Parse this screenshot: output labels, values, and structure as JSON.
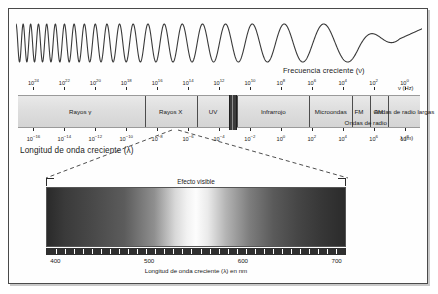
{
  "figure": {
    "frequency_caption": "Frecuencia creciente (ν)",
    "wavelength_caption": "Longitud de onda creciente (λ)",
    "frequency_unit": "ν (Hz)",
    "wavelength_unit": "λ (m)"
  },
  "chart_data": {
    "type": "bar",
    "xlabel": "Longitud de onda creciente (λ)",
    "ylabel": "",
    "frequency_axis": {
      "label": "Frecuencia creciente (ν)",
      "unit": "ν (Hz)",
      "exponents": [
        24,
        22,
        20,
        18,
        16,
        14,
        12,
        10,
        8,
        6,
        4,
        2,
        0
      ],
      "tick_labels": [
        "10⁻",
        "10",
        "10",
        "10",
        "10",
        "10",
        "10",
        "10",
        "10",
        "10",
        "10",
        "10",
        "10"
      ],
      "direction": "decreasing left to right"
    },
    "wavelength_axis": {
      "label": "Longitud de onda creciente (λ)",
      "unit": "λ (m)",
      "exponents": [
        -16,
        -14,
        -12,
        -10,
        -8,
        -6,
        -4,
        -2,
        0,
        2,
        4,
        6,
        8
      ],
      "direction": "increasing left to right"
    },
    "bands": [
      {
        "name": "Rayos γ",
        "start_pct": 0.0,
        "end_pct": 31.5
      },
      {
        "name": "Rayos X",
        "start_pct": 31.5,
        "end_pct": 44.5
      },
      {
        "name": "UV",
        "start_pct": 44.5,
        "end_pct": 52.5
      },
      {
        "name": "visible",
        "start_pct": 52.5,
        "end_pct": 54.5
      },
      {
        "name": "Infrarrojo",
        "start_pct": 54.5,
        "end_pct": 72.5
      },
      {
        "name": "Microondas",
        "start_pct": 72.5,
        "end_pct": 83.0
      },
      {
        "name": "FM",
        "start_pct": 83.0,
        "end_pct": 87.5
      },
      {
        "name": "AM",
        "start_pct": 87.5,
        "end_pct": 92.0
      },
      {
        "name": "Ondas de radio largas",
        "start_pct": 92.0,
        "end_pct": 100.0
      }
    ],
    "band_labels": [
      {
        "text": "Rayos γ",
        "center_pct": 15.5,
        "row": "main"
      },
      {
        "text": "Rayos X",
        "center_pct": 38.0,
        "row": "main"
      },
      {
        "text": "UV",
        "center_pct": 48.5,
        "row": "main"
      },
      {
        "text": "Infrarrojo",
        "center_pct": 63.5,
        "row": "main"
      },
      {
        "text": "Microondas",
        "center_pct": 77.8,
        "row": "main"
      },
      {
        "text": "FM",
        "center_pct": 84.8,
        "row": "main"
      },
      {
        "text": "AM",
        "center_pct": 89.7,
        "row": "main"
      },
      {
        "text": "Ondas de radio",
        "center_pct": 86.5,
        "row": "low"
      },
      {
        "text": "Ondas de radio largas",
        "center_pct": 96.0,
        "row": "main"
      }
    ],
    "inset": {
      "title": "Efecto visible",
      "xlabel": "Longitud de onda creciente (λ) en nm",
      "tick_values": [
        400,
        500,
        600,
        700
      ],
      "xlim": [
        390,
        710
      ],
      "type": "spectrum gradient",
      "gradient_note": "grayscale reproduction of visible spectrum, brightest near 560 nm"
    }
  }
}
